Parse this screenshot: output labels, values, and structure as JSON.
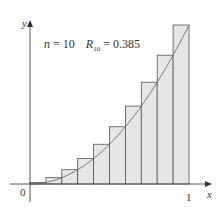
{
  "chart_data": {
    "type": "bar",
    "title": "",
    "annotation": {
      "n_label": "n = 10",
      "r_label_main": "R",
      "r_label_sub": "10",
      "r_value": " = 0.385"
    },
    "function": "y = x^2",
    "n": 10,
    "R10": 0.385,
    "xlabel": "x",
    "ylabel": "y",
    "x_ticks": [
      "0",
      "1"
    ],
    "xlim": [
      0,
      1
    ],
    "ylim": [
      0,
      1
    ],
    "categories": [
      "0.1",
      "0.2",
      "0.3",
      "0.4",
      "0.5",
      "0.6",
      "0.7",
      "0.8",
      "0.9",
      "1.0"
    ],
    "values": [
      0.01,
      0.04,
      0.09,
      0.16,
      0.25,
      0.36,
      0.49,
      0.64,
      0.81,
      1.0
    ],
    "bar_fill": "#e6e6e6",
    "bar_stroke": "#555555",
    "curve_color": "#666666"
  },
  "labels": {
    "y_axis": "y",
    "x_axis": "x",
    "origin": "0",
    "one": "1",
    "n_text": "n = 10",
    "R": "R",
    "R_sub": "10",
    "R_val": " = 0.385"
  }
}
